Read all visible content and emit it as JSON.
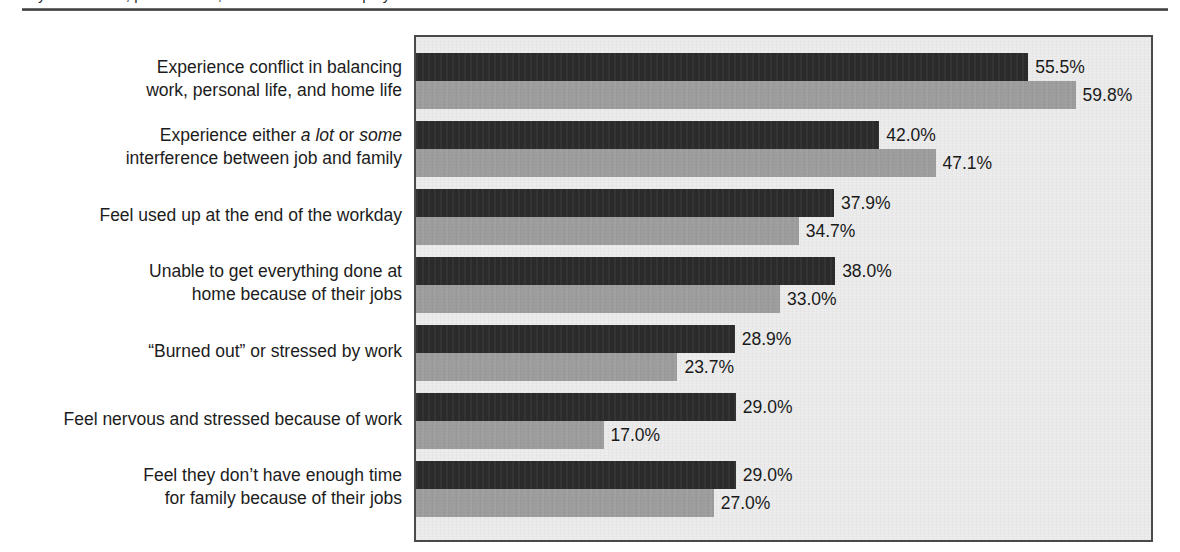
{
  "page": {
    "clipped_header_text": "y of the work, personal life, and home life of employees",
    "rule_color": "#3c3c3c"
  },
  "chart_data": {
    "type": "bar",
    "orientation": "horizontal",
    "title": "",
    "xlabel": "",
    "ylabel": "",
    "xlim": [
      0,
      67
    ],
    "grid": false,
    "legend_position": "none",
    "value_label_suffix": "%",
    "categories": [
      "Experience conflict in balancing work, personal life, and home life",
      "Experience either a lot or some interference between job and family",
      "Feel used up at the end of the workday",
      "Unable to get everything done at home because of their jobs",
      "“Burned out” or stressed by work",
      "Feel nervous and stressed because of work",
      "Feel they don’t have enough time for family because of their jobs"
    ],
    "category_lines": [
      [
        "Experience conflict in balancing",
        "work, personal life, and home life"
      ],
      [
        "Experience either <em>a lot</em> or <em>some</em>",
        "interference between job and family"
      ],
      [
        "Feel used up at the end of the workday"
      ],
      [
        "Unable to get everything done at",
        "home because of their jobs"
      ],
      [
        "“Burned out” or stressed by work"
      ],
      [
        "Feel nervous and stressed because of work"
      ],
      [
        "Feel they don’t have enough time",
        "for family because of their jobs"
      ]
    ],
    "series": [
      {
        "name": "series-1",
        "color": "#2b2b2b",
        "values": [
          55.5,
          42.0,
          37.9,
          38.0,
          28.9,
          29.0,
          29.0
        ],
        "labels": [
          "55.5%",
          "42.0%",
          "37.9%",
          "38.0%",
          "28.9%",
          "29.0%",
          "29.0%"
        ]
      },
      {
        "name": "series-2",
        "color": "#9d9d9d",
        "values": [
          59.8,
          47.1,
          34.7,
          33.0,
          23.7,
          17.0,
          27.0
        ],
        "labels": [
          "59.8%",
          "47.1%",
          "34.7%",
          "33.0%",
          "23.7%",
          "17.0%",
          "27.0%"
        ]
      }
    ]
  },
  "geometry": {
    "plot_left_px": 414,
    "plot_top_px": 21,
    "plot_width_px": 739,
    "plot_height_px": 507,
    "px_per_percent": 11.03,
    "bar_height_px": 28,
    "group_pitch_px": 68,
    "first_group_top_px": 21
  },
  "colors": {
    "plot_background": "#ececec",
    "plot_border": "#4a4a4a",
    "series_1": "#2b2b2b",
    "series_2": "#9d9d9d",
    "page_background": "#ffffff",
    "text": "#1a1a1a"
  }
}
